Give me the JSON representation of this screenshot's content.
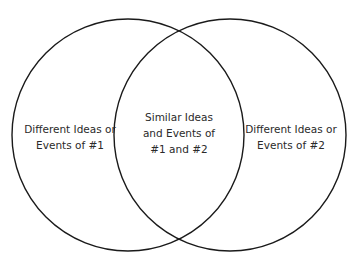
{
  "diagram": {
    "type": "venn",
    "stroke_color": "#1a1a1a",
    "text_color": "#2a2a2a",
    "background": "#ffffff",
    "circles": [
      {
        "id": "set-1",
        "cx": 128,
        "cy": 135,
        "r": 116
      },
      {
        "id": "set-2",
        "cx": 230,
        "cy": 135,
        "r": 116
      }
    ],
    "regions": {
      "left": {
        "lines": [
          "Different Ideas or",
          "Events of #1"
        ]
      },
      "middle": {
        "lines": [
          "Similar Ideas",
          "and Events of",
          "#1 and #2"
        ]
      },
      "right": {
        "lines": [
          "Different Ideas or",
          "Events of #2"
        ]
      }
    }
  }
}
